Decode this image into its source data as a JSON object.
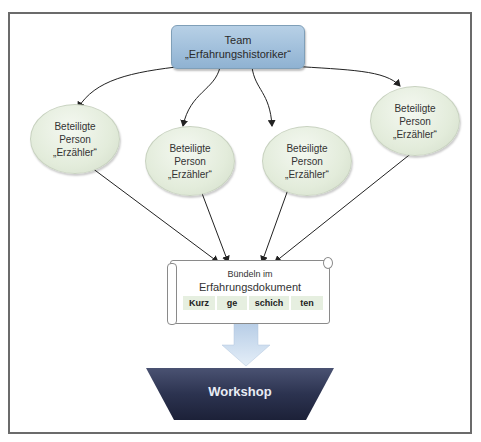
{
  "diagram": {
    "top_node": {
      "line1": "Team",
      "line2": "„Erfahrungshistoriker“"
    },
    "participants": [
      {
        "line1": "Beteiligte",
        "line2": "Person",
        "line3": "„Erzähler“"
      },
      {
        "line1": "Beteiligte",
        "line2": "Person",
        "line3": "„Erzähler“"
      },
      {
        "line1": "Beteiligte",
        "line2": "Person",
        "line3": "„Erzähler“"
      },
      {
        "line1": "Beteiligte",
        "line2": "Person",
        "line3": "„Erzähler“"
      }
    ],
    "document": {
      "line1": "Bündeln im",
      "line2": "Erfahrungsdokument",
      "syllables": [
        "Kurz",
        "ge",
        "schich",
        "ten"
      ]
    },
    "output": {
      "label": "Workshop"
    },
    "colors": {
      "top_node": "#a3c1dc",
      "participant": "#e3ecdb",
      "syllable_bg": "#e6efe0",
      "arrow_block": "#c7d9ee",
      "workshop": "#2c3350",
      "frame": "#6b6b6b"
    }
  }
}
